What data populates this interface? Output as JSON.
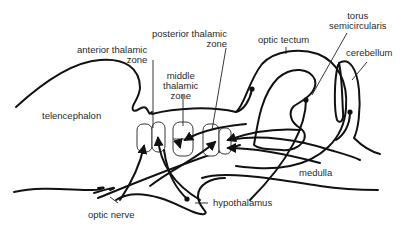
{
  "diagram": {
    "type": "neuroanatomy-sagittal-brain-schematic",
    "labels": {
      "telencephalon": "telencephalon",
      "anterior_thalamic_zone_1": "anterior thalamic",
      "anterior_thalamic_zone_2": "zone",
      "posterior_thalamic_zone_1": "posterior thalamic",
      "posterior_thalamic_zone_2": "zone",
      "middle_thalamic_zone_1": "middle",
      "middle_thalamic_zone_2": "thalamic",
      "middle_thalamic_zone_3": "zone",
      "optic_tectum": "optic tectum",
      "torus_1": "torus",
      "torus_2": "semicircularis",
      "cerebellum": "cerebellum",
      "medulla": "medulla",
      "hypothalamus": "hypothalamus",
      "optic_nerve": "optic nerve"
    },
    "colors": {
      "line": "#111111",
      "text": "#2a2a2a",
      "background": "#ffffff"
    }
  }
}
